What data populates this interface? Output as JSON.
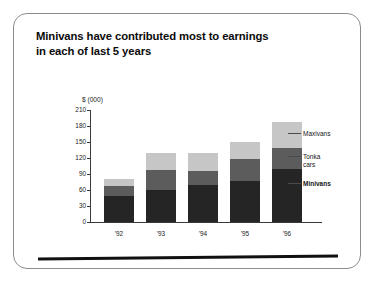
{
  "slide": {
    "title_line1": "Minivans have contributed most to earnings",
    "title_line2": "in each of last 5 years"
  },
  "chart_data": {
    "type": "bar",
    "stacked": true,
    "title": "Minivans have contributed most to earnings in each of last 5 years",
    "xlabel": "",
    "ylabel": "$ (000)",
    "axis_unit_label": "$ (000)",
    "categories": [
      "'92",
      "'93",
      "'94",
      "'95",
      "'96"
    ],
    "yticks": [
      210,
      180,
      150,
      120,
      90,
      60,
      30,
      0
    ],
    "ylim": [
      0,
      210
    ],
    "grid": false,
    "legend_position": "right",
    "series": [
      {
        "name": "Minivans",
        "color": "#252525",
        "values": [
          48,
          60,
          70,
          77,
          100
        ]
      },
      {
        "name": "Tonka cars",
        "color": "#5c5c5c",
        "values": [
          20,
          38,
          25,
          41,
          38
        ]
      },
      {
        "name": "Maxivans",
        "color": "#c6c6c6",
        "values": [
          12,
          32,
          35,
          32,
          50
        ]
      }
    ],
    "totals": [
      80,
      130,
      130,
      150,
      188
    ]
  },
  "legend": {
    "maxivans": "Maxivans",
    "tonka_line1": "Tonka",
    "tonka_line2": "cars",
    "minivans": "Minivans"
  }
}
